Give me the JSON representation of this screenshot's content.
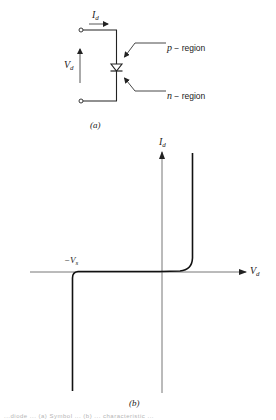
{
  "figure_a": {
    "caption": "(a)",
    "current_label": {
      "main": "I",
      "sub": "d"
    },
    "voltage_label": {
      "main": "V",
      "sub": "d"
    },
    "p_region_label": {
      "letter": "p",
      "text": " − region"
    },
    "n_region_label": {
      "letter": "n",
      "text": " − region"
    }
  },
  "figure_b": {
    "caption": "(b)",
    "y_axis_label": {
      "main": "I",
      "sub": "d"
    },
    "x_axis_label": {
      "main": "V",
      "sub": "d"
    },
    "breakdown_label": {
      "main": "−V",
      "sub": "s"
    }
  },
  "footer_caption": "...diode ... (a) Symbol ... (b) ... characteristic ..."
}
